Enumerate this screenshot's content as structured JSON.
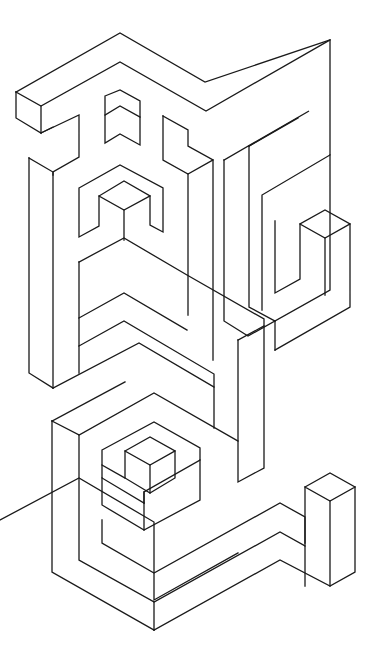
{
  "image": {
    "kind": "isometric-line-art",
    "description": "Black-on-white isometric maze-like line drawing of two stylized glyph blocks",
    "background": "#ffffff",
    "stroke": "#1a1a1a",
    "width": 374,
    "height": 647
  },
  "drawing": {
    "top_glyph": {
      "paths": [
        "M16,92 L120,33 L205,82 L330,40 L330,155 L262,195 L262,310",
        "M16,92 L41,106 L120,62 L206,111 L330,40",
        "M16,92 L16,118 L41,133 L41,106",
        "M41,133 L79,115 L79,157 L53,172 L53,175",
        "M41,133 L53,127",
        "M29,158 L53,172 L53,388",
        "M29,158 L29,373 L53,388",
        "M105,96 L120,90 L140,101 L140,145 L120,134 L105,143 Z",
        "M105,115 L120,106 L140,117",
        "M163,116 L188,130 L188,146 L213,160 L213,360",
        "M163,116 L163,160 L188,174 L213,160",
        "M188,174 L188,315",
        "M224,160 L224,321 L248,336 L330,290 L330,155",
        "M224,160 L309,111 L249,146",
        "M249,146 L249,307 L275,321",
        "M249,146 L298,118",
        "M275,221 L275,293 L300,279 L300,224 L325,210 L350,224 L350,307 L275,350",
        "M300,224 L325,238 L350,224",
        "M325,238 L325,295",
        "M275,321 L275,350",
        "M79,188 L120,165 L163,188 L163,232 L150,225 L150,196 L124,181 L99,196 L99,226 L79,237 Z",
        "M99,196 L124,210 L150,196",
        "M124,210 L124,240",
        "M79,262 L124,238 L187,275 L264,319 L264,468 L238,482 L238,340",
        "M79,262 L79,318 L124,293 L187,330",
        "M79,318 L79,346 L124,321 L214,374 L214,428",
        "M79,346 L79,373",
        "M238,340 L264,326",
        "M53,388 L139,343 L214,387"
      ]
    },
    "bottom_glyph": {
      "paths": [
        "M0,520 L79,478 L154,522 L154,600 L238,553",
        "M52,421 L79,435 L79,560 L154,602 L154,630",
        "M52,421 L52,572 L154,630",
        "M79,435 L154,393 L238,441",
        "M52,421 L125,382",
        "M102,450 L154,422 L200,448 L200,460 L144,492 L144,503 L102,478 Z",
        "M102,465 L125,478",
        "M125,451 L150,437 L175,451 L175,478 L150,493 L125,478 Z",
        "M125,451 L150,465 L175,451",
        "M150,465 L150,493",
        "M144,492 L144,503",
        "M102,478 L102,505 L144,530 L200,500 L200,460",
        "M144,503 L144,530",
        "M102,520 L102,543 L154,573 L280,503 L305,517 L305,543",
        "M154,602 L280,532 L305,546 L305,586",
        "M154,630 L280,560 L330,586 L355,572 L355,487",
        "M305,487 L330,473 L355,487 L330,501 Z",
        "M330,501 L330,586",
        "M305,487 L305,546"
      ]
    }
  }
}
